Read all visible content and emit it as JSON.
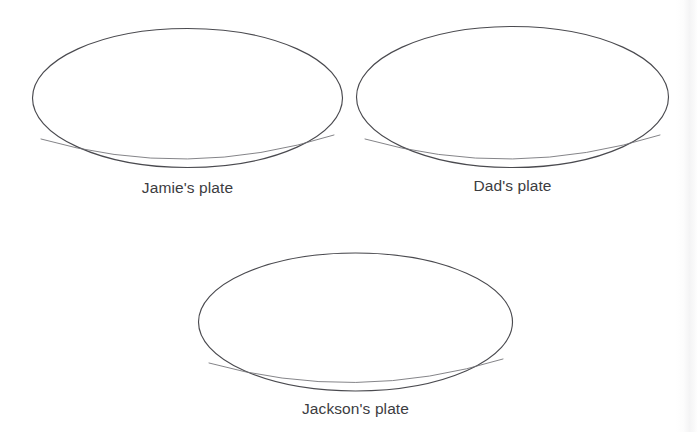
{
  "page": {
    "background_color": "#ffffff",
    "stroke_color": "#4a4a4f",
    "label_color": "#3c3c3f"
  },
  "plates": [
    {
      "id": "jamie",
      "label": "Jamie's plate",
      "shape": "ellipse",
      "width": 311,
      "height": 141,
      "contents": []
    },
    {
      "id": "dad",
      "label": "Dad's plate",
      "shape": "ellipse",
      "width": 313,
      "height": 143,
      "contents": []
    },
    {
      "id": "jackson",
      "label": "Jackson's plate",
      "shape": "ellipse",
      "width": 315,
      "height": 140,
      "contents": []
    }
  ]
}
